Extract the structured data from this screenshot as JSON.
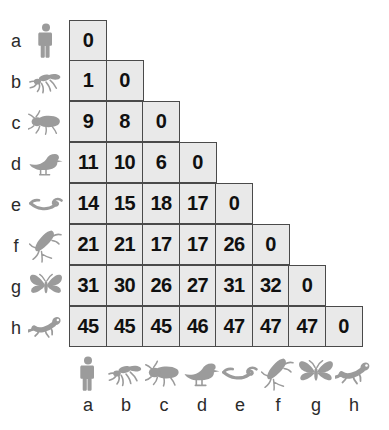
{
  "figure": {
    "type": "distance-matrix",
    "style": {
      "cell_fill": "#e9e9e9",
      "cell_border": "#4a4a4a",
      "value_color": "#101010",
      "label_color": "#2b2b2b",
      "icon_color": "#9a9a9a",
      "background": "#ffffff"
    }
  },
  "chart_data": {
    "type": "heatmap",
    "title": "",
    "xlabel": "",
    "ylabel": "",
    "shape": "lower-triangular",
    "grid": true,
    "legend": "none",
    "categories": [
      "a",
      "b",
      "c",
      "d",
      "e",
      "f",
      "g",
      "h"
    ],
    "row_labels": [
      "a",
      "b",
      "c",
      "d",
      "e",
      "f",
      "g",
      "h"
    ],
    "column_labels": [
      "a",
      "b",
      "c",
      "d",
      "e",
      "f",
      "g",
      "h"
    ],
    "row_icons": [
      "human-icon",
      "fly-icon",
      "beetle-icon",
      "duck-icon",
      "worm-icon",
      "dragonfly-icon",
      "butterfly-icon",
      "newt-icon"
    ],
    "column_icons": [
      "human-icon",
      "fly-icon",
      "beetle-icon",
      "duck-icon",
      "worm-icon",
      "dragonfly-icon",
      "butterfly-icon",
      "newt-icon"
    ],
    "values": [
      [
        0
      ],
      [
        1,
        0
      ],
      [
        9,
        8,
        0
      ],
      [
        11,
        10,
        6,
        0
      ],
      [
        14,
        15,
        18,
        17,
        0
      ],
      [
        21,
        21,
        17,
        17,
        26,
        0
      ],
      [
        31,
        30,
        26,
        27,
        31,
        32,
        0
      ],
      [
        45,
        45,
        45,
        46,
        47,
        47,
        47,
        0
      ]
    ],
    "value_range": [
      0,
      47
    ]
  }
}
